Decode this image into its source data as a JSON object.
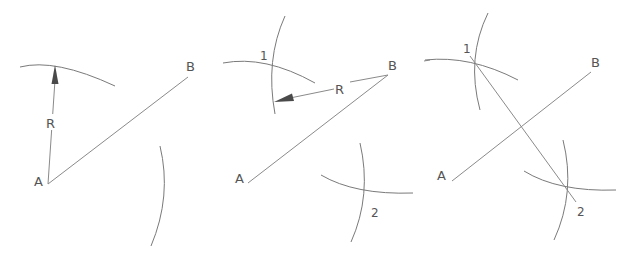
{
  "diagram": {
    "stroke_color": "#8a8a8a",
    "background": "#ffffff",
    "panels": [
      {
        "step": 1,
        "labels": {
          "a": "A",
          "b": "B",
          "radius": "R"
        },
        "description": "Arc of radius R drawn from A, and from the other side"
      },
      {
        "step": 2,
        "labels": {
          "a": "A",
          "b": "B",
          "radius": "R",
          "intersection_top": "1",
          "intersection_bottom": "2"
        },
        "description": "Same radius R drawn from B; arcs intersect at points 1 and 2"
      },
      {
        "step": 3,
        "labels": {
          "a": "A",
          "b": "B",
          "intersection_top": "1",
          "intersection_bottom": "2"
        },
        "description": "Line through 1 and 2 bisects AB"
      }
    ]
  }
}
